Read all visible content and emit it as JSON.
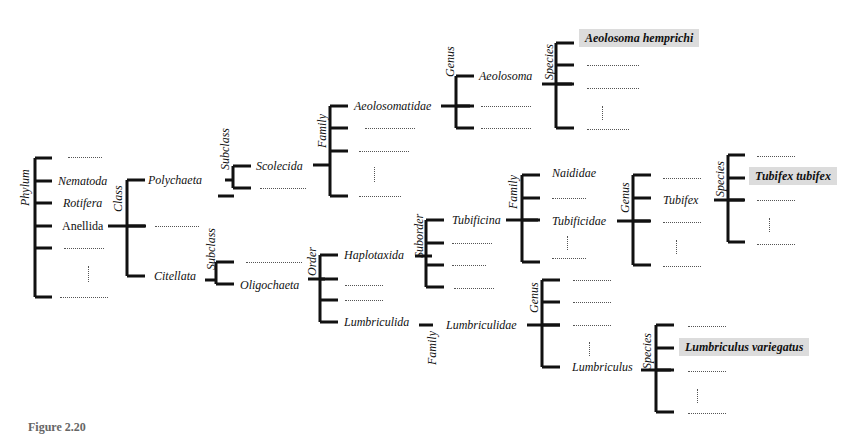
{
  "diagram": {
    "type": "taxonomy-tree",
    "ranks": {
      "phylum": "Phylum",
      "class": "Class",
      "subclass": "Subclass",
      "order": "Order",
      "suborder": "Suborder",
      "family": "Family",
      "genus": "Genus",
      "species": "Species"
    },
    "phylum_children": [
      "Nematoda",
      "Rotifera",
      "Anellida"
    ],
    "class_children": [
      "Polychaeta",
      "Citellata"
    ],
    "polychaeta_subclass": [
      "Scolecida"
    ],
    "scolecida_family": [
      "Aeolosomatidae"
    ],
    "aeolosomatidae_genus": [
      "Aeolosoma"
    ],
    "aeolosoma_species": [
      "Aeolosoma hemprichi"
    ],
    "citellata_subclass": [
      "Oligochaeta"
    ],
    "oligochaeta_order": [
      "Haplotaxida",
      "Lumbriculida"
    ],
    "haplotaxida_suborder": [
      "Tubificina"
    ],
    "tubificina_family": [
      "Naididae",
      "Tubificidae"
    ],
    "tubificidae_genus": [
      "Tubifex"
    ],
    "tubifex_species": [
      "Tubifex tubifex"
    ],
    "lumbriculida_family": [
      "Lumbriculidae"
    ],
    "lumbriculidae_genus": [
      "Lumbriculus"
    ],
    "lumbriculus_species": [
      "Lumbriculus variegatus"
    ],
    "highlighted": [
      "Aeolosoma hemprichi",
      "Tubifex tubifex",
      "Lumbriculus variegatus"
    ],
    "highlight_color": "#dcdcdc",
    "caption_partial": "Figure 2.20"
  }
}
